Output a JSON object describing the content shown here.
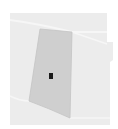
{
  "map": {
    "width": 118,
    "height": 129,
    "colors": {
      "page_background": "#ffffff",
      "map_background": "#ececec",
      "road_line": "#f7f7f7",
      "parcel_fill": "#cfcfcf",
      "parcel_stroke": "#c4c4c4",
      "marker_fill": "#1a1a1a"
    },
    "parcel": {
      "label": "",
      "points": "40,29 72,32 70,118 29,101"
    },
    "marker": {
      "x": 49,
      "y": 73,
      "width": 4,
      "height": 6
    }
  }
}
